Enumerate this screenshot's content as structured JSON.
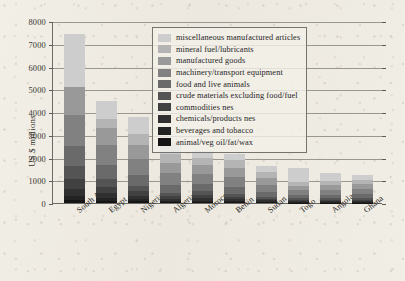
{
  "chart_data": {
    "type": "bar",
    "title": "",
    "xlabel": "",
    "ylabel": "US $ millions",
    "ylim": [
      0,
      8000
    ],
    "ytick_step": 1000,
    "yticks": [
      "0",
      "1000",
      "2000",
      "3000",
      "4000",
      "5000",
      "6000",
      "7000",
      "8000"
    ],
    "grid": true,
    "stacked": true,
    "legend_position": "top-center-right",
    "categories": [
      "South Africa",
      "Egypt",
      "Nigeria",
      "Algeria",
      "Morocco",
      "Benin",
      "Sudan",
      "Togo",
      "Angola",
      "Ghana"
    ],
    "series": [
      {
        "name": "animal/veg oil/fat/wax",
        "color": "#151515",
        "values": [
          120,
          90,
          70,
          40,
          40,
          35,
          25,
          20,
          20,
          20
        ]
      },
      {
        "name": "beverages and tobacco",
        "color": "#232323",
        "values": [
          180,
          150,
          110,
          60,
          70,
          55,
          40,
          30,
          30,
          30
        ]
      },
      {
        "name": "chemicals/products nes",
        "color": "#303030",
        "values": [
          330,
          210,
          150,
          90,
          110,
          80,
          55,
          40,
          40,
          45
        ]
      },
      {
        "name": "commodities nes",
        "color": "#414141",
        "values": [
          420,
          260,
          180,
          110,
          130,
          95,
          65,
          50,
          50,
          55
        ]
      },
      {
        "name": "crude materials excluding food/fuel",
        "color": "#545454",
        "values": [
          560,
          330,
          240,
          150,
          170,
          130,
          90,
          70,
          70,
          75
        ]
      },
      {
        "name": "food and live animals",
        "color": "#6a6a6a",
        "values": [
          900,
          620,
          470,
          330,
          330,
          300,
          210,
          150,
          160,
          170
        ]
      },
      {
        "name": "machinery/transport equipment",
        "color": "#818181",
        "values": [
          1350,
          900,
          700,
          520,
          430,
          430,
          300,
          200,
          210,
          220
        ]
      },
      {
        "name": "manufactured goods",
        "color": "#999999",
        "values": [
          1240,
          730,
          620,
          480,
          380,
          420,
          300,
          200,
          200,
          210
        ]
      },
      {
        "name": "mineral fuel/lubricants",
        "color": "#b4b4b4",
        "values": [
          0,
          410,
          490,
          370,
          300,
          330,
          270,
          180,
          180,
          180
        ]
      },
      {
        "name": "miscellaneous manufactured articles",
        "color": "#cdcdcd",
        "values": [
          2350,
          780,
          740,
          530,
          350,
          300,
          270,
          590,
          350,
          230
        ]
      }
    ],
    "totals": [
      7450,
      4480,
      3770,
      2680,
      2310,
      2175,
      1625,
      1530,
      1310,
      1235
    ]
  },
  "legend": {
    "items": [
      "miscellaneous manufactured articles",
      "mineral fuel/lubricants",
      "manufactured goods",
      "machinery/transport equipment",
      "food and live animals",
      "crude materials excluding food/fuel",
      "commodities nes",
      "chemicals/products nes",
      "beverages and tobacco",
      "animal/veg oil/fat/wax"
    ],
    "colors": [
      "#cdcdcd",
      "#b4b4b4",
      "#999999",
      "#818181",
      "#6a6a6a",
      "#545454",
      "#414141",
      "#303030",
      "#232323",
      "#151515"
    ]
  }
}
